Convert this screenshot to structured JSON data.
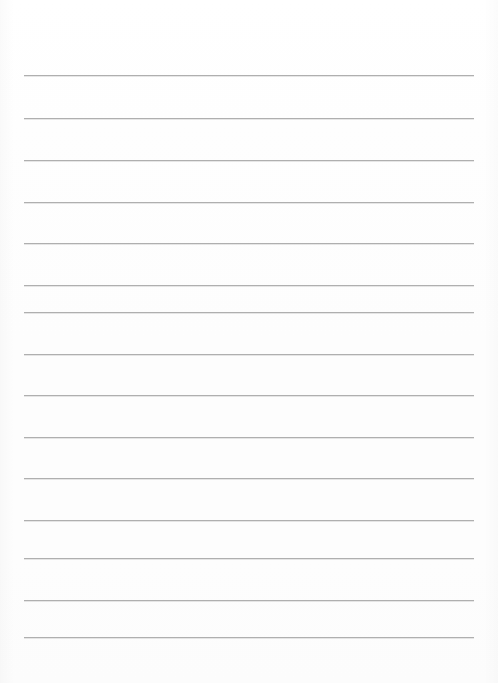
{
  "page": {
    "kind": "blank-ruled-writing-sheet",
    "width_px": 498,
    "height_px": 683,
    "background_color": "#fefefe",
    "has_border": false,
    "has_margin_rule": false,
    "has_holes": false,
    "text_content": ""
  },
  "rules": {
    "count": 14,
    "color": "#a9a9a9",
    "thickness_px": 1,
    "left_x_px": 24,
    "right_x_px": 474,
    "length_px": 450,
    "spacing_px": 42,
    "first_line_y_px": 75,
    "last_line_y_px": 637,
    "lines": [
      {
        "index": 1,
        "y": 75,
        "label": "rule-line-1"
      },
      {
        "index": 2,
        "y": 118,
        "label": "rule-line-2"
      },
      {
        "index": 3,
        "y": 160,
        "label": "rule-line-3"
      },
      {
        "index": 4,
        "y": 202,
        "label": "rule-line-4"
      },
      {
        "index": 5,
        "y": 243,
        "label": "rule-line-5"
      },
      {
        "index": 6,
        "y": 285,
        "label": "rule-line-6"
      },
      {
        "index": 7,
        "y": 312,
        "label": "rule-line-7"
      },
      {
        "index": 8,
        "y": 354,
        "label": "rule-line-8"
      },
      {
        "index": 9,
        "y": 395,
        "label": "rule-line-9"
      },
      {
        "index": 10,
        "y": 437,
        "label": "rule-line-10"
      },
      {
        "index": 11,
        "y": 478,
        "label": "rule-line-11"
      },
      {
        "index": 12,
        "y": 520,
        "label": "rule-line-12"
      },
      {
        "index": 13,
        "y": 558,
        "label": "rule-line-13"
      },
      {
        "index": 14,
        "y": 600,
        "label": "rule-line-14"
      },
      {
        "index": 15,
        "y": 637,
        "label": "rule-line-15"
      }
    ]
  },
  "margins": {
    "top_blank_height_px": 75,
    "bottom_blank_height_px": 46,
    "left_blank_width_px": 24,
    "right_blank_width_px": 24
  }
}
